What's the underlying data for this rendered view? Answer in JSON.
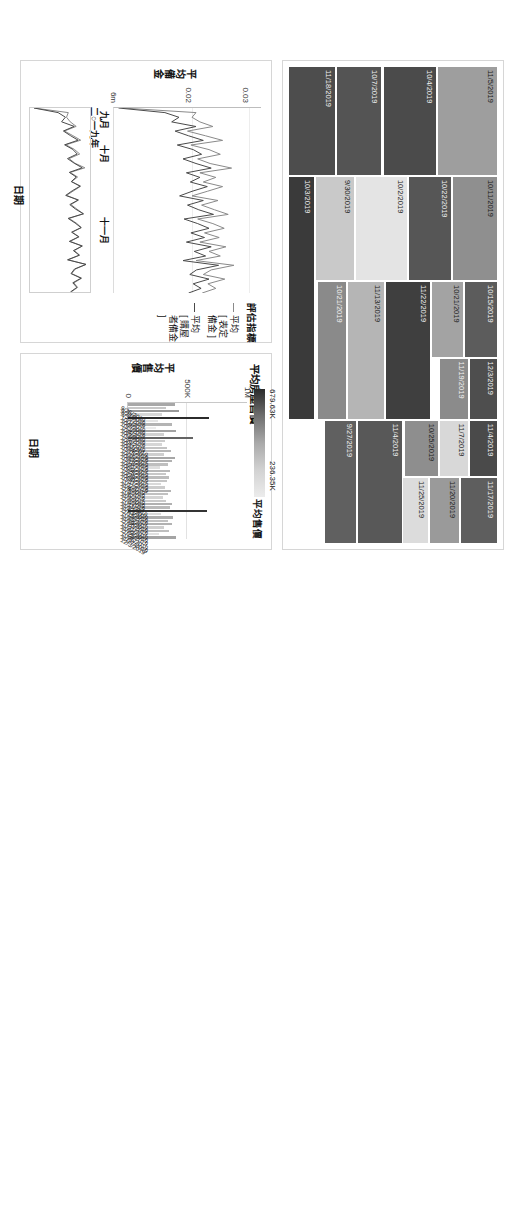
{
  "dashboard": {
    "background": "#ffffff",
    "panel_border": "#d6d6d6"
  },
  "treemap": {
    "name": "房屋售價樹狀圖",
    "cells": [
      {
        "label": "11/5/2019",
        "color": "#9e9e9e"
      },
      {
        "label": "10/11/2019",
        "color": "#8f8f8f"
      },
      {
        "label": "10/15/2019",
        "color": "#5c5c5c"
      },
      {
        "label": "12/3/2019",
        "color": "#4e4e4e"
      },
      {
        "label": "11/4/2019",
        "color": "#4a4a4a"
      },
      {
        "label": "11/17/2019",
        "color": "#5e5e5e"
      },
      {
        "label": "10/21/2019",
        "color": "#a3a3a3"
      },
      {
        "label": "11/19/2019",
        "color": "#8b8b8b"
      },
      {
        "label": "11/7/2019",
        "color": "#d8d8d8"
      },
      {
        "label": "11/20/2019",
        "color": "#9a9a9a"
      },
      {
        "label": "10/22/2019",
        "color": "#565656"
      },
      {
        "label": "11/22/2019",
        "color": "#3f3f3f"
      },
      {
        "label": "10/25/2019",
        "color": "#8e8e8e"
      },
      {
        "label": "11/25/2019",
        "color": "#dcdcdc"
      },
      {
        "label": "10/4/2019",
        "color": "#4b4b4b"
      },
      {
        "label": "10/2/2019",
        "color": "#e4e4e4"
      },
      {
        "label": "11/13/2019",
        "color": "#b5b5b5"
      },
      {
        "label": "11/4/2019",
        "color": "#585858"
      },
      {
        "label": "10/7/2019",
        "color": "#545454"
      },
      {
        "label": "9/30/2019",
        "color": "#c9c9c9"
      },
      {
        "label": "10/21/2019",
        "color": "#8a8a8a"
      },
      {
        "label": "9/27/2019",
        "color": "#606060"
      },
      {
        "label": "11/18/2019",
        "color": "#4d4d4d"
      },
      {
        "label": "10/3/2019",
        "color": "#3a3a3a"
      }
    ]
  },
  "line_chart": {
    "y_axis_title": "平均備金",
    "x_axis_title": "日期",
    "y_ticks": [
      "0.03",
      "0.02",
      "6m"
    ],
    "x_month_labels": [
      "九月",
      "十月",
      "十一月"
    ],
    "x_year_label": "二○一九年",
    "legend_title": "評估指標",
    "legend_items": [
      "平均\n[ 表定備金 ]",
      "平均\n[ 購屋者備金 ]"
    ],
    "legend_item_1_line1": "平均",
    "legend_item_1_line2": "[ 表定備金 ]",
    "legend_item_2_line1": "平均",
    "legend_item_2_line2": "[ 購屋者備金 ]"
  },
  "bar_chart": {
    "title": "平均房屋售價",
    "y_axis_title": "平均售價",
    "x_axis_title": "日期",
    "y_ticks": [
      "1M",
      "500K",
      "0"
    ],
    "legend_title": "平均售價",
    "legend_max": "679.63K",
    "legend_min": "236.35K"
  },
  "chart_data": [
    {
      "type": "bar",
      "title": "平均房屋售價",
      "xlabel": "日期",
      "ylabel": "平均售價",
      "ylim": [
        0,
        1000000
      ],
      "yticks": [
        0,
        500000,
        1000000
      ],
      "ytick_labels": [
        "0",
        "500K",
        "1M"
      ],
      "grid": true,
      "legend_position": "top-right",
      "color_scale": {
        "min": 236350,
        "max": 679630,
        "min_label": "236.35K",
        "max_label": "679.63K",
        "min_color": "#ececec",
        "max_color": "#2b2b2b"
      },
      "categories": [
        "9/26/2019",
        "9/27/2019",
        "9/30/2019",
        "10/1/2019",
        "10/2/2019",
        "10/3/2019",
        "10/4/2019",
        "10/7/2019",
        "10/8/2019",
        "10/9/2019",
        "10/11/2019",
        "10/14/2019",
        "10/15/2019",
        "10/16/2019",
        "10/17/2019",
        "10/18/2019",
        "10/21/2019",
        "10/22/2019",
        "10/25/2019",
        "10/29/2019",
        "10/30/2019",
        "10/31/2019",
        "11/1/2019",
        "11/4/2019",
        "11/5/2019",
        "11/6/2019",
        "11/7/2019",
        "11/8/2019",
        "11/11/2019",
        "11/12/2019",
        "11/13/2019",
        "11/15/2019",
        "11/18/2019",
        "11/19/2019",
        "11/20/2019",
        "11/21/2019",
        "11/22/2019",
        "11/25/2019",
        "11/26/2019",
        "11/27/2019",
        "12/3/2019"
      ],
      "values": [
        392000,
        321000,
        426000,
        284000,
        679630,
        252000,
        366000,
        236350,
        404000,
        299000,
        548000,
        312000,
        288000,
        331000,
        358000,
        302000,
        396000,
        372000,
        340000,
        268000,
        355000,
        318000,
        347000,
        326000,
        281000,
        309000,
        364000,
        334000,
        293000,
        316000,
        372000,
        351000,
        660000,
        279000,
        381000,
        334000,
        369000,
        303000,
        342000,
        263000,
        402000
      ]
    },
    {
      "type": "line",
      "title": "",
      "xlabel": "日期",
      "ylabel": "平均備金",
      "ylim": [
        0.006,
        0.032
      ],
      "yticks": [
        0.02,
        0.03
      ],
      "ytick_labels": [
        "0.02",
        "0.03"
      ],
      "grid": true,
      "legend_position": "right",
      "series": [
        {
          "name": "平均[ 表定備金 ]",
          "color": "#8a8a8a",
          "values": [
            0.0075,
            0.0205,
            0.0198,
            0.0212,
            0.0235,
            0.019,
            0.0222,
            0.0252,
            0.0196,
            0.0228,
            0.0248,
            0.0208,
            0.023,
            0.0268,
            0.0212,
            0.024,
            0.0218,
            0.0252,
            0.0225,
            0.0198,
            0.0244,
            0.0215,
            0.0238,
            0.0262,
            0.0208,
            0.0235,
            0.0255,
            0.022,
            0.0246,
            0.0212,
            0.0258,
            0.0228,
            0.0248,
            0.0205,
            0.0272,
            0.0232,
            0.0218,
            0.0256,
            0.0226,
            0.024,
            0.0216
          ]
        },
        {
          "name": "平均[ 購屋者備金 ]",
          "color": "#4a4a4a",
          "values": [
            0.0068,
            0.015,
            0.0175,
            0.0162,
            0.0205,
            0.0168,
            0.0192,
            0.0218,
            0.0172,
            0.02,
            0.0215,
            0.0182,
            0.0205,
            0.0232,
            0.0188,
            0.0212,
            0.0195,
            0.0225,
            0.0198,
            0.0176,
            0.0218,
            0.019,
            0.021,
            0.0236,
            0.0184,
            0.0208,
            0.0228,
            0.0196,
            0.022,
            0.0188,
            0.0232,
            0.0202,
            0.0222,
            0.0182,
            0.0245,
            0.0206,
            0.0194,
            0.0228,
            0.02,
            0.0214,
            0.0192
          ]
        }
      ],
      "x": [
        "9/26/2019",
        "9/27/2019",
        "9/30/2019",
        "10/1/2019",
        "10/2/2019",
        "10/3/2019",
        "10/4/2019",
        "10/7/2019",
        "10/8/2019",
        "10/9/2019",
        "10/11/2019",
        "10/14/2019",
        "10/15/2019",
        "10/16/2019",
        "10/17/2019",
        "10/18/2019",
        "10/21/2019",
        "10/22/2019",
        "10/25/2019",
        "10/29/2019",
        "10/30/2019",
        "10/31/2019",
        "11/1/2019",
        "11/4/2019",
        "11/5/2019",
        "11/6/2019",
        "11/7/2019",
        "11/8/2019",
        "11/11/2019",
        "11/12/2019",
        "11/13/2019",
        "11/15/2019",
        "11/18/2019",
        "11/19/2019",
        "11/20/2019",
        "11/21/2019",
        "11/22/2019",
        "11/25/2019",
        "11/26/2019",
        "11/27/2019",
        "12/3/2019"
      ]
    },
    {
      "type": "treemap",
      "title": "",
      "labels": [
        "11/5/2019",
        "10/11/2019",
        "10/15/2019",
        "12/3/2019",
        "11/4/2019",
        "11/17/2019",
        "10/21/2019",
        "11/19/2019",
        "11/7/2019",
        "11/20/2019",
        "10/22/2019",
        "11/22/2019",
        "10/25/2019",
        "11/25/2019",
        "10/4/2019",
        "10/2/2019",
        "11/13/2019",
        "11/4/2019",
        "10/7/2019",
        "9/30/2019",
        "10/21/2019",
        "9/27/2019",
        "11/18/2019",
        "10/3/2019"
      ],
      "colors": [
        "#9e9e9e",
        "#8f8f8f",
        "#5c5c5c",
        "#4e4e4e",
        "#4a4a4a",
        "#5e5e5e",
        "#a3a3a3",
        "#8b8b8b",
        "#d8d8d8",
        "#9a9a9a",
        "#565656",
        "#3f3f3f",
        "#8e8e8e",
        "#dcdcdc",
        "#4b4b4b",
        "#e4e4e4",
        "#b5b5b5",
        "#585858",
        "#545454",
        "#c9c9c9",
        "#8a8a8a",
        "#606060",
        "#4d4d4d",
        "#3a3a3a"
      ]
    }
  ]
}
